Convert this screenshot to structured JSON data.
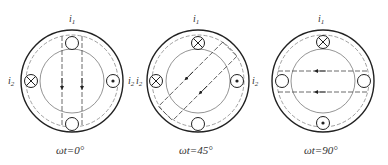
{
  "figure": {
    "panels": [
      {
        "caption": "ωt=0°",
        "cx": 72,
        "cy": 81,
        "labels": {
          "top": "i1",
          "left": "i2",
          "right": "i2"
        },
        "conductors": {
          "top": "empty",
          "left": "cross",
          "right": "dot",
          "bottom": "empty"
        },
        "field_angle_deg": 0,
        "arrow_direction": "down"
      },
      {
        "caption": "ωt=45°",
        "cx": 198,
        "cy": 81,
        "labels": {
          "top": "i1",
          "left": "i2",
          "right": "i2"
        },
        "conductors": {
          "top": "cross",
          "left": "cross",
          "right": "dot",
          "bottom": "empty"
        },
        "field_angle_deg": 45,
        "arrow_direction": "down-left"
      },
      {
        "caption": "ωt=90°",
        "cx": 323,
        "cy": 81,
        "labels": {
          "top": "i1"
        },
        "conductors": {
          "top": "cross",
          "left": "empty",
          "right": "empty",
          "bottom": "dot"
        },
        "field_angle_deg": 90,
        "arrow_direction": "left"
      }
    ],
    "symbols": {
      "cross": "⊗ current into page",
      "dot": "⊙ current out of page",
      "empty": "zero current"
    }
  }
}
